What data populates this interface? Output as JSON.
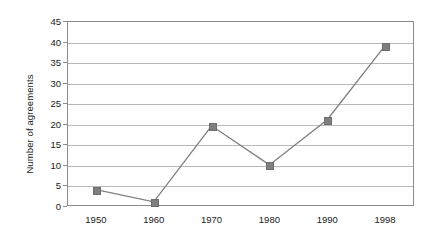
{
  "chart_data": {
    "type": "line",
    "title": "",
    "xlabel": "",
    "ylabel": "Number of agreements",
    "categories": [
      "1950",
      "1960",
      "1970",
      "1980",
      "1990",
      "1998"
    ],
    "values": [
      4,
      1,
      19.5,
      10,
      21,
      39
    ],
    "series": [
      {
        "name": "Number of agreements",
        "values": [
          4,
          1,
          19.5,
          10,
          21,
          39
        ]
      }
    ],
    "ylim": [
      0,
      45
    ],
    "yticks": [
      0,
      5,
      10,
      15,
      20,
      25,
      30,
      35,
      40,
      45
    ],
    "ytick_labels": [
      "0",
      "5",
      "10",
      "15",
      "20",
      "25",
      "30",
      "35",
      "40",
      "45"
    ],
    "xtick_labels": [
      "1950",
      "1960",
      "1970",
      "1980",
      "1990",
      "1998"
    ],
    "grid": "horizontal",
    "legend": "none",
    "marker": "square",
    "colors": {
      "line": "#7f7f7f",
      "marker": "#7f7f7f",
      "grid": "#b9b9b9",
      "axis": "#8c8c8c",
      "text": "#1a1a1a",
      "background": "#ffffff"
    }
  }
}
